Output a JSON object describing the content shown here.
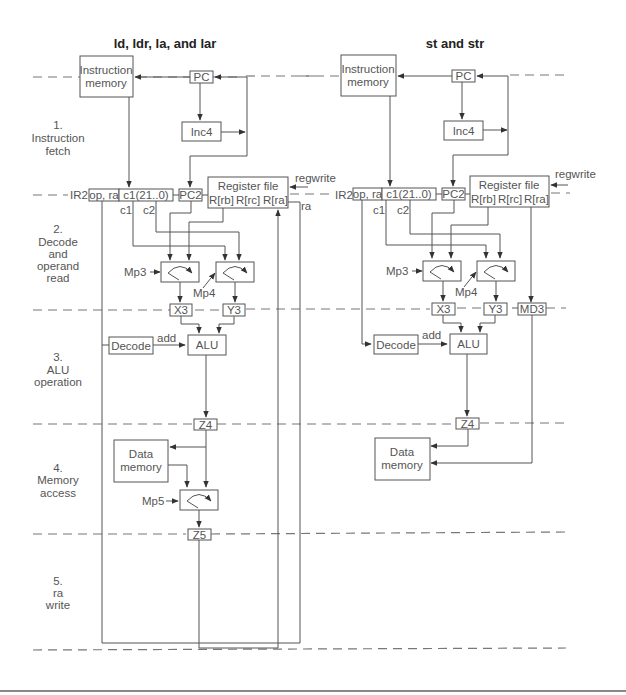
{
  "diagram": {
    "left_title": "ld, ldr, la, and lar",
    "right_title": "st and str",
    "stages": [
      {
        "number": "1.",
        "line1": "Instruction",
        "line2": "fetch"
      },
      {
        "number": "2.",
        "line1": "Decode",
        "line2": "and",
        "line3": "operand",
        "line4": "read"
      },
      {
        "number": "3.",
        "line1": "ALU",
        "line2": "operation"
      },
      {
        "number": "4.",
        "line1": "Memory",
        "line2": "access"
      },
      {
        "number": "5.",
        "line1": "ra",
        "line2": "write"
      }
    ],
    "blocks": {
      "instruction_memory_1": "Instruction",
      "instruction_memory_2": "memory",
      "pc": "PC",
      "inc4": "Inc4",
      "ir2": "IR2",
      "op_ra": "op, ra",
      "c1_field": "c1(21..0)",
      "pc2": "PC2",
      "register_file": "Register file",
      "rb": "R[rb]",
      "rc": "R[rc]",
      "ra_port": "R[ra]",
      "regwrite": "regwrite",
      "ra": "ra",
      "c1": "c1",
      "c2": "c2",
      "mp3": "Mp3",
      "mp4": "Mp4",
      "mp5": "Mp5",
      "x3": "X3",
      "y3": "Y3",
      "md3": "MD3",
      "decode": "Decode",
      "add": "add",
      "alu": "ALU",
      "z4": "Z4",
      "z5": "Z5",
      "data_memory_1": "Data",
      "data_memory_2": "memory"
    }
  }
}
